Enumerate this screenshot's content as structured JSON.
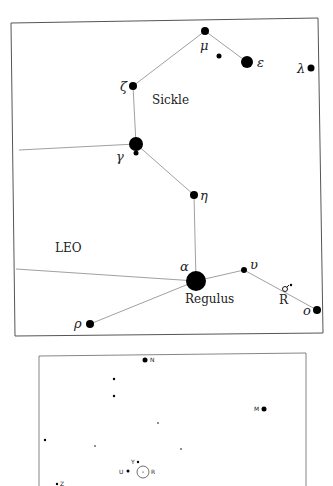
{
  "chart_top": {
    "title": "LEO",
    "asterism_label": "Sickle",
    "regulus_label": "Regulus",
    "variable_label": "R",
    "stars": [
      {
        "id": "mu",
        "label": "μ",
        "x": 205,
        "y": 31,
        "r": 4
      },
      {
        "id": "mu-companion",
        "label": "",
        "x": 219,
        "y": 56,
        "r": 2.5
      },
      {
        "id": "epsilon",
        "label": "ε",
        "x": 247,
        "y": 62,
        "r": 6
      },
      {
        "id": "lambda",
        "label": "λ",
        "x": 311,
        "y": 68,
        "r": 3.5
      },
      {
        "id": "zeta",
        "label": "ζ",
        "x": 133,
        "y": 86,
        "r": 4
      },
      {
        "id": "gamma",
        "label": "γ",
        "x": 136,
        "y": 144,
        "r": 7
      },
      {
        "id": "eta",
        "label": "η",
        "x": 194,
        "y": 195,
        "r": 4
      },
      {
        "id": "alpha",
        "label": "α",
        "x": 196,
        "y": 281,
        "r": 10
      },
      {
        "id": "upsilon",
        "label": "υ",
        "x": 244,
        "y": 270,
        "r": 3
      },
      {
        "id": "omicron",
        "label": "ο",
        "x": 317,
        "y": 310,
        "r": 4
      },
      {
        "id": "rho",
        "label": "ρ",
        "x": 90,
        "y": 324,
        "r": 4
      }
    ]
  },
  "chart_bottom": {
    "labels": [
      "N",
      "M",
      "Y",
      "U",
      "R",
      "Z"
    ],
    "stars": [
      {
        "label": "N",
        "x": 145,
        "y": 360,
        "r": 2.5
      },
      {
        "label": "",
        "x": 114,
        "y": 379,
        "r": 1.2
      },
      {
        "label": "",
        "x": 114,
        "y": 396,
        "r": 1.2
      },
      {
        "label": "M",
        "x": 264,
        "y": 409,
        "r": 2.5
      },
      {
        "label": "",
        "x": 158,
        "y": 423,
        "r": 0.8
      },
      {
        "label": "",
        "x": 45,
        "y": 440,
        "r": 1.2
      },
      {
        "label": "",
        "x": 95,
        "y": 446,
        "r": 0.8
      },
      {
        "label": "",
        "x": 181,
        "y": 449,
        "r": 0.8
      },
      {
        "label": "Y",
        "x": 138,
        "y": 462,
        "r": 1.2
      },
      {
        "label": "U",
        "x": 128,
        "y": 471,
        "r": 1.5
      },
      {
        "label": "Z",
        "x": 57,
        "y": 484,
        "r": 1.2
      }
    ],
    "target": {
      "label": "R",
      "x": 143,
      "y": 472,
      "r": 6
    }
  }
}
